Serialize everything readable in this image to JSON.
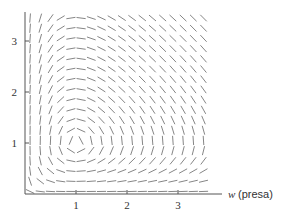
{
  "chart_data": {
    "type": "direction_field",
    "title": "",
    "system": {
      "dw_dt": "w - w*r",
      "dr_dt": "-r + w*r",
      "equilibrium": [
        1,
        1
      ]
    },
    "xlabel_var": "w",
    "xlabel_text": "(presa)",
    "ylabel": "",
    "x_ticks": [
      1,
      2,
      3
    ],
    "y_ticks": [
      1,
      2,
      3
    ],
    "x_tick_labels": [
      "1",
      "2",
      "3"
    ],
    "y_tick_labels": [
      "1",
      "2",
      "3"
    ],
    "xlim": [
      0,
      3.6
    ],
    "ylim": [
      0,
      3.6
    ],
    "grid": false,
    "legend": null,
    "field_grid_step": 0.2,
    "colors": {
      "axis": "#555555",
      "segments": "#777777",
      "text": "#333333"
    }
  }
}
